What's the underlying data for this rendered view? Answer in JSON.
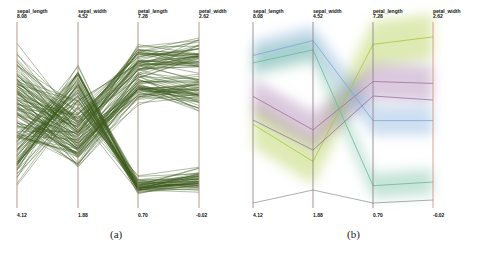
{
  "chart_data": [
    {
      "type": "parallel_coordinates",
      "caption": "(a)",
      "style": "polylines",
      "line_color": "#3d5a1e",
      "axes": [
        {
          "name": "sepal_length",
          "max": "8.08",
          "min": "4.12"
        },
        {
          "name": "sepal_width",
          "max": "4.52",
          "min": "1.88"
        },
        {
          "name": "petal_length",
          "max": "7.28",
          "min": "0.70"
        },
        {
          "name": "petal_width",
          "max": "2.62",
          "min": "-0.02"
        }
      ],
      "ylim_normalized": [
        0,
        1
      ]
    },
    {
      "type": "parallel_coordinates",
      "caption": "(b)",
      "style": "density_bands",
      "axes": [
        {
          "name": "sepal_length",
          "max": "8.08",
          "min": "4.12"
        },
        {
          "name": "sepal_width",
          "max": "4.52",
          "min": "1.88"
        },
        {
          "name": "petal_length",
          "max": "7.28",
          "min": "0.70"
        },
        {
          "name": "petal_width",
          "max": "2.62",
          "min": "-0.02"
        }
      ],
      "clusters": [
        {
          "name": "green-yellow",
          "color": "#a8c83a",
          "values": [
            0.55,
            0.75,
            0.12,
            0.08
          ]
        },
        {
          "name": "purple",
          "color": "#a070a8",
          "values": [
            0.4,
            0.58,
            0.32,
            0.33
          ]
        },
        {
          "name": "blue",
          "color": "#7aa8d8",
          "values": [
            0.18,
            0.1,
            0.53,
            0.53
          ]
        },
        {
          "name": "teal-green",
          "color": "#6ab89a",
          "values": [
            0.22,
            0.15,
            0.88,
            0.86
          ]
        }
      ]
    }
  ],
  "captions": {
    "a": "(a)",
    "b": "(b)"
  }
}
